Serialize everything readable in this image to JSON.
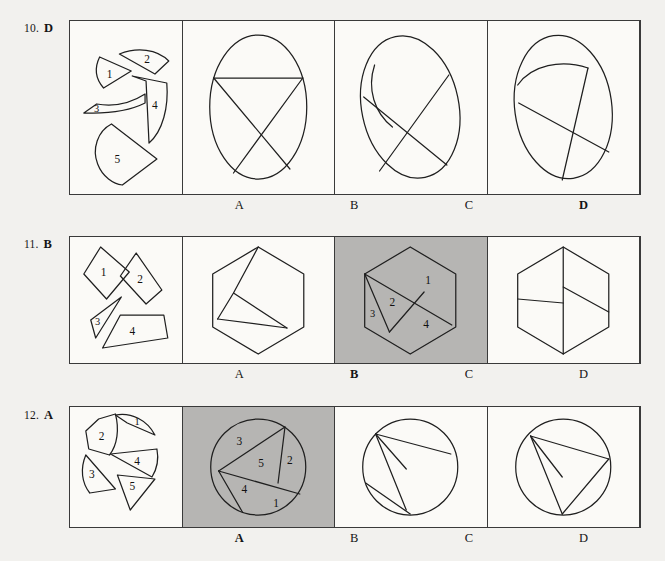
{
  "page": {
    "background_color": "#f2f1ee",
    "shaded_color": "#b6b5b3",
    "line_color": "#1f1f1f",
    "type": "shape-assembly-reasoning-test"
  },
  "rows": [
    {
      "id": "row-10",
      "number": "10.",
      "answer": "D",
      "pieces_count": 5,
      "piece_labels": [
        "1",
        "2",
        "3",
        "4",
        "5"
      ],
      "assembled_shape": "ellipse",
      "options": [
        {
          "letter": "A",
          "correct": false
        },
        {
          "letter": "B",
          "correct": false
        },
        {
          "letter": "C",
          "correct": false
        },
        {
          "letter": "D",
          "correct": true
        }
      ],
      "solution_region_labels": [
        "1",
        "2",
        "3",
        "4",
        "5"
      ]
    },
    {
      "id": "row-11",
      "number": "11.",
      "answer": "B",
      "pieces_count": 4,
      "piece_labels": [
        "1",
        "2",
        "3",
        "4"
      ],
      "assembled_shape": "hexagon",
      "options": [
        {
          "letter": "A",
          "correct": false
        },
        {
          "letter": "B",
          "correct": true
        },
        {
          "letter": "C",
          "correct": false
        },
        {
          "letter": "D",
          "correct": false
        }
      ],
      "solution_region_labels": [
        "1",
        "2",
        "3",
        "4"
      ]
    },
    {
      "id": "row-12",
      "number": "12.",
      "answer": "A",
      "pieces_count": 5,
      "piece_labels": [
        "1",
        "2",
        "3",
        "4",
        "5"
      ],
      "assembled_shape": "circle",
      "options": [
        {
          "letter": "A",
          "correct": true
        },
        {
          "letter": "B",
          "correct": false
        },
        {
          "letter": "C",
          "correct": false
        },
        {
          "letter": "D",
          "correct": false
        }
      ],
      "solution_region_labels": [
        "1",
        "2",
        "3",
        "4",
        "5"
      ]
    }
  ]
}
